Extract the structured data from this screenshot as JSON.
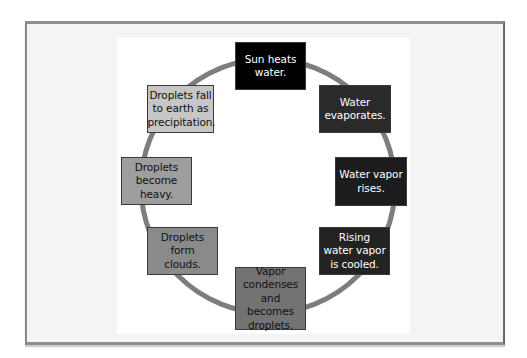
{
  "diagram": {
    "type": "cycle",
    "title": "",
    "ring_color": "#7d7d7d",
    "steps": [
      {
        "id": 1,
        "label": "Sun heats water.",
        "fill": "#000000",
        "text_color": "#ffffff"
      },
      {
        "id": 2,
        "label": "Water evaporates.",
        "fill": "#2a2a2a",
        "text_color": "#ffffff"
      },
      {
        "id": 3,
        "label": "Water vapor rises.",
        "fill": "#1c1c1c",
        "text_color": "#ffffff"
      },
      {
        "id": 4,
        "label": "Rising water vapor is cooled.",
        "fill": "#232323",
        "text_color": "#ffffff"
      },
      {
        "id": 5,
        "label": "Vapor condenses and becomes droplets.",
        "fill": "#737373",
        "text_color": "#111111"
      },
      {
        "id": 6,
        "label": "Droplets form clouds.",
        "fill": "#8a8a8a",
        "text_color": "#111111"
      },
      {
        "id": 7,
        "label": "Droplets become heavy.",
        "fill": "#9e9e9e",
        "text_color": "#111111"
      },
      {
        "id": 8,
        "label": "Droplets fall to earth as precipitation.",
        "fill": "#c6c6c6",
        "text_color": "#111111"
      }
    ]
  }
}
